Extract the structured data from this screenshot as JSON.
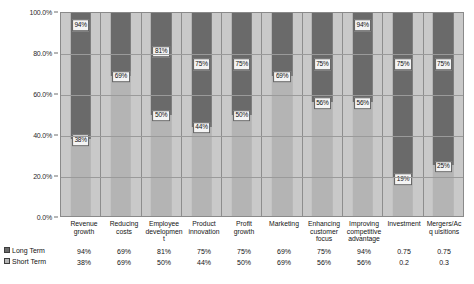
{
  "chart_data": {
    "type": "bar",
    "subtype": "100% stacked column with data table",
    "title": "",
    "xlabel": "",
    "ylabel": "",
    "ylim": [
      0,
      100
    ],
    "grid": true,
    "legend_position": "bottom-left (data table row headers)",
    "y_ticks": [
      "0.0%",
      "20.0%",
      "40.0%",
      "60.0%",
      "80.0%",
      "100.0%"
    ],
    "y_tick_values": [
      0,
      20,
      40,
      60,
      80,
      100
    ],
    "categories": [
      "Revenue growth",
      "Reducing costs",
      "Employee development",
      "Product innovation",
      "Profit growth",
      "Marketing",
      "Enhancing customer focus",
      "Improving competitive advantage",
      "Investment",
      "Mergers/Acq uisitions"
    ],
    "series": [
      {
        "name": "Long Term",
        "color": "#6a6a6a",
        "values": [
          94,
          69,
          81,
          75,
          75,
          69,
          75,
          94,
          75,
          75
        ],
        "labels": [
          "94%",
          "69%",
          "81%",
          "75%",
          "75%",
          "69%",
          "75%",
          "94%",
          "75%",
          "75%"
        ],
        "table_values": [
          "94%",
          "69%",
          "81%",
          "75%",
          "75%",
          "69%",
          "75%",
          "94%",
          "0.75",
          "0.75"
        ]
      },
      {
        "name": "Short Term",
        "color": "#b4b4b4",
        "values": [
          38,
          69,
          50,
          44,
          50,
          69,
          56,
          56,
          19,
          25
        ],
        "labels": [
          "38%",
          "69%",
          "50%",
          "44%",
          "50%",
          "69%",
          "56%",
          "56%",
          "19%",
          "25%"
        ],
        "table_values": [
          "38%",
          "69%",
          "50%",
          "44%",
          "50%",
          "69%",
          "56%",
          "56%",
          "0.2",
          "0.3"
        ]
      }
    ]
  },
  "legend": {
    "long_term_label": "Long Term",
    "short_term_label": "Short Term",
    "long_term_swatch": "square-dark-icon",
    "short_term_swatch": "square-light-icon"
  }
}
